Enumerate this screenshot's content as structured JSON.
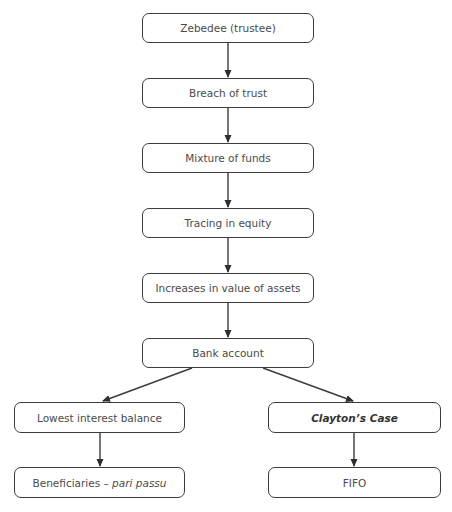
{
  "heading": "Answer structure",
  "nodes": {
    "zebedee": {
      "label": "Zebedee (trustee)"
    },
    "breach": {
      "label": "Breach of trust"
    },
    "mixture": {
      "label": "Mixture of funds"
    },
    "tracing": {
      "label": "Tracing in equity"
    },
    "increases": {
      "label": "Increases in value of assets"
    },
    "bank": {
      "label": "Bank account"
    },
    "lowest": {
      "label": "Lowest interest balance"
    },
    "clayton": {
      "label": "Clayton’s Case"
    },
    "beneficiaries": {
      "label": "Beneficiaries – ",
      "label_italic": "pari passu"
    },
    "fifo": {
      "label": "FIFO"
    }
  },
  "edges": [
    [
      "zebedee",
      "breach"
    ],
    [
      "breach",
      "mixture"
    ],
    [
      "mixture",
      "tracing"
    ],
    [
      "tracing",
      "increases"
    ],
    [
      "increases",
      "bank"
    ],
    [
      "bank",
      "lowest"
    ],
    [
      "bank",
      "clayton"
    ],
    [
      "lowest",
      "beneficiaries"
    ],
    [
      "clayton",
      "fifo"
    ]
  ],
  "colors": {
    "stroke": "#3b3b3b",
    "text": "#4a4a4a"
  }
}
